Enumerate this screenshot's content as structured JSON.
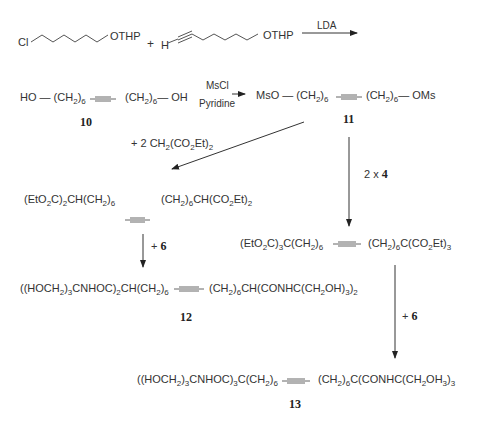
{
  "scheme": {
    "row1": {
      "reactant_a_left": "Cl",
      "reactant_a_right": "OTHP",
      "plus": "+",
      "reactant_b_left": "H",
      "reactant_b_right": "OTHP",
      "reagent": "LDA"
    },
    "compound10": {
      "left": "HO — (CH",
      "sub1": "2",
      "mid1": ")",
      "sub2": "6",
      "triple": "≡",
      "right1": "(CH",
      "sub3": "2",
      "right2": ")",
      "sub4": "6",
      "right3": "— OH",
      "label": "10"
    },
    "arrow1": {
      "reagent_top": "MsCl",
      "reagent_bottom": "Pyridine"
    },
    "compound11": {
      "left": "MsO — (CH",
      "sub1": "2",
      "mid1": ")",
      "sub2": "6",
      "right1": "(CH",
      "sub3": "2",
      "right2": ")",
      "sub4": "6",
      "right3": "— OMs",
      "label": "11"
    },
    "malonate_reagent": {
      "text1": "+ 2 CH",
      "sub1": "2",
      "text2": "(CO",
      "sub2": "2",
      "text3": "Et)",
      "sub3": "2"
    },
    "arrow_down_right": {
      "label_prefix": "2 x",
      "label_bold": "4"
    },
    "diester": {
      "left": "(EtO",
      "s1": "2",
      "l2": "C)",
      "s2": "2",
      "l3": "CH(CH",
      "s3": "2",
      "l4": ")",
      "s4": "6",
      "r1": "(CH",
      "rs1": "2",
      "r2": ")",
      "rs2": "6",
      "r3": "CH(CO",
      "rs3": "2",
      "r4": "Et)",
      "rs4": "2"
    },
    "arrow_left_down": {
      "label_prefix": "+",
      "label_bold": "6"
    },
    "triester": {
      "l1": "(EtO",
      "s1": "2",
      "l2": "C)",
      "s2": "3",
      "l3": "C(CH",
      "s3": "2",
      "l4": ")",
      "s4": "6",
      "r1": "(CH",
      "rs1": "2",
      "r2": ")",
      "rs2": "6",
      "r3": "C(CO",
      "rs3": "2",
      "r4": "Et)",
      "rs4": "3"
    },
    "compound12": {
      "l1": "((HOCH",
      "s1": "2",
      "l2": ")",
      "s2": "3",
      "l3": "CNHOC)",
      "s3": "2",
      "l4": "CH(CH",
      "s4": "2",
      "l5": ")",
      "s5": "6",
      "r1": "(CH",
      "rs1": "2",
      "r2": ")",
      "rs2": "6",
      "r3": "CH(CONHC(CH",
      "rs3": "2",
      "r4": "OH)",
      "rs4": "3",
      "r5": ")",
      "rs5": "2",
      "label": "12"
    },
    "arrow_right_down": {
      "label_prefix": "+",
      "label_bold": "6"
    },
    "compound13": {
      "l1": "((HOCH",
      "s1": "2",
      "l2": ")",
      "s2": "3",
      "l3": "CNHOC)",
      "s3": "3",
      "l4": "C(CH",
      "s4": "2",
      "l5": ")",
      "s5": "6",
      "r1": "(CH",
      "rs1": "2",
      "r2": ")",
      "rs2": "6",
      "r3": "C(CONHC(CH",
      "rs3": "2",
      "r4": "OH",
      "rs4": "3",
      "r5": ")",
      "rs5": "3",
      "label": "13"
    }
  }
}
